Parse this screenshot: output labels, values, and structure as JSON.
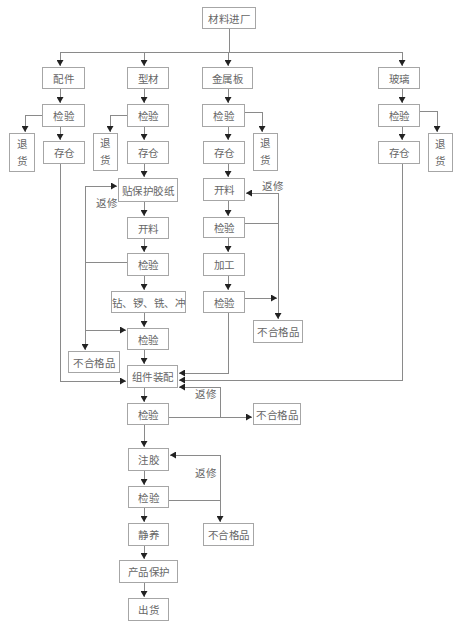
{
  "diagram": {
    "start": "材料进厂",
    "fittings": {
      "label": "配件",
      "inspect": "检验",
      "reject": "退货",
      "store": "存仓"
    },
    "profiles": {
      "label": "型材",
      "inspect": "检验",
      "reject": "退货",
      "store": "存仓",
      "protect_film": "贴保护胶纸",
      "cut": "开料",
      "inspect2": "检验",
      "machining": "钻、锣、铣、冲",
      "inspect3": "检验",
      "nonconforming": "不合格品",
      "rework": "返修"
    },
    "metal_sheet": {
      "label": "金属板",
      "inspect": "检验",
      "reject": "退货",
      "store": "存仓",
      "cut": "开料",
      "inspect2": "检验",
      "process": "加工",
      "inspect3": "检验",
      "nonconforming": "不合格品",
      "rework": "返修"
    },
    "glass": {
      "label": "玻璃",
      "inspect": "检验",
      "reject": "退货",
      "store": "存仓"
    },
    "assembly": {
      "label": "组件装配",
      "inspect": "检验",
      "nonconforming": "不合格品",
      "rework": "返修"
    },
    "gluing": {
      "label": "注胶",
      "inspect": "检验",
      "nonconforming": "不合格品",
      "rework": "返修"
    },
    "curing": "静养",
    "protection": "产品保护",
    "shipping": "出货"
  }
}
